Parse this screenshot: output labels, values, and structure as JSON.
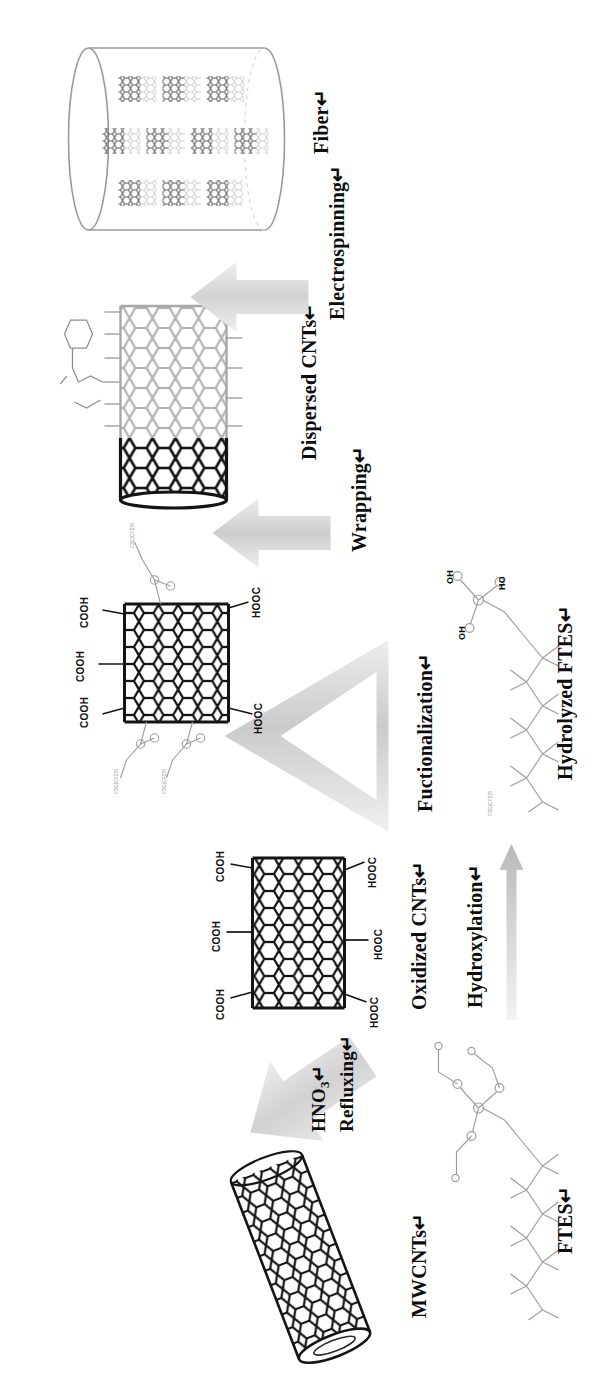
{
  "figure": {
    "background_color": "#ffffff",
    "ink_color": "#111111",
    "arrow_color": "#cfcfcf",
    "faded_ink_color": "#a8a8a8"
  },
  "stages": [
    {
      "id": "mwcnt",
      "label": "MWCNTs↵",
      "kind": "nanotube",
      "description": "pristine multi-walled carbon nanotube drawn as a tilted hexagonal-lattice cylinder"
    },
    {
      "id": "oxidized",
      "label": "Oxidized CNTs↵",
      "kind": "nanotube",
      "description": "carbon nanotube bearing carboxylic acid groups",
      "groups_top": [
        "COOH",
        "COOH",
        "COOH"
      ],
      "groups_bottom": [
        "HOOC",
        "HOOC",
        "HOOC"
      ]
    },
    {
      "id": "functionalized",
      "label": "",
      "kind": "nanotube",
      "description": "carbon nanotube grafted with hydrolyzed fluorosilane chains",
      "groups_top": [
        "COOH",
        "COOH",
        "COOH"
      ],
      "groups_bottom": [
        "HOOC",
        "HOOC"
      ],
      "silane_tags": [
        "F3C(CF2)5",
        "F3C(CF2)5",
        "F3C(CF2)5",
        "F3C(CF2)5"
      ]
    },
    {
      "id": "dispersed",
      "label": "Dispersed CNTs↵",
      "kind": "nanotube-wrapped",
      "description": "half-dark half-faded nanotube wrapped by polymer chains with a pendant aromatic ring"
    },
    {
      "id": "fiber",
      "label": "Fiber↵",
      "kind": "cylinder",
      "description": "electrospun fiber cylinder with CNT clusters aligned inside",
      "cluster_columns": 3,
      "clusters_per_column": 5
    }
  ],
  "reagents": [
    {
      "id": "ftes",
      "label": "FTES↵",
      "description": "1H,1H,2H,2H-perfluorooctyltriethoxysilane skeletal structure"
    },
    {
      "id": "hydrolyzed-ftes",
      "label": "Hydrolyzed FTES↵",
      "description": "silanol form of FTES with three OH groups on silicon",
      "atom_labels": [
        "OH",
        "OH",
        "HO"
      ],
      "tag": "F3C(CF2)5"
    }
  ],
  "arrows": [
    {
      "id": "refluxing",
      "lines": [
        "HNO3↵",
        "Refluxing↵"
      ],
      "line1_main": "HNO",
      "line1_sub": "3",
      "line1_tail": "↵",
      "style": "block-arrow"
    },
    {
      "id": "functionalization",
      "lines": [
        "Fuctionalization↵"
      ],
      "style": "flat-wide-arrow"
    },
    {
      "id": "wrapping",
      "lines": [
        "Wrapping↵"
      ],
      "style": "block-arrow"
    },
    {
      "id": "electrospinning",
      "lines": [
        "Electrospinning↵"
      ],
      "style": "block-arrow"
    },
    {
      "id": "hydroxylation",
      "lines": [
        "Hydroxylation↵"
      ],
      "style": "thin-arrow"
    }
  ]
}
